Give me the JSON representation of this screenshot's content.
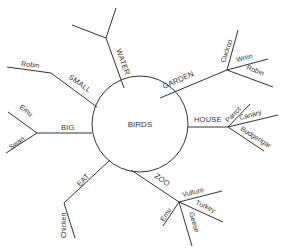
{
  "diagram": {
    "type": "mind-map",
    "center": {
      "label": "BIRDS"
    },
    "branches": [
      {
        "label": "WATER",
        "children": []
      },
      {
        "label": "GARDEN",
        "children": [
          "Cuckoo",
          "Wren",
          "Robin"
        ]
      },
      {
        "label": "HOUSE",
        "children": [
          "Parrot",
          "Canary",
          "Budgerigar"
        ]
      },
      {
        "label": "ZOO",
        "children": [
          "Vulture",
          "Turkey",
          "Geese",
          "Emu"
        ]
      },
      {
        "label": "EAT",
        "children": [
          "Chicken"
        ]
      },
      {
        "label": "BIG",
        "children": [
          "Emu",
          "Swan"
        ]
      },
      {
        "label": "SMALL",
        "children": [
          "Robin"
        ]
      }
    ]
  },
  "colors": {
    "line": "#333333",
    "text": "#333333",
    "background": "#ffffff"
  }
}
